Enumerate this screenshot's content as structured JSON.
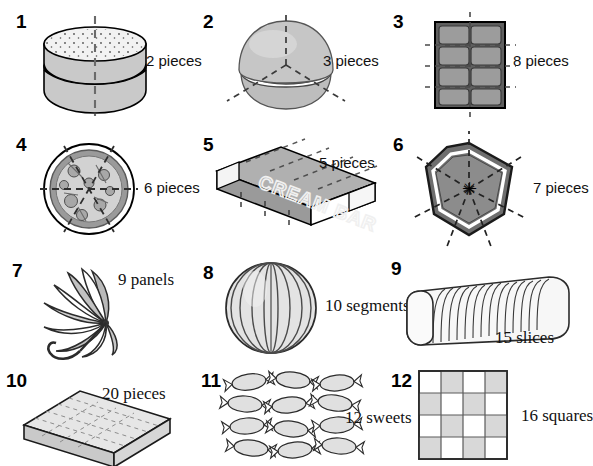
{
  "page": {
    "columns": 3,
    "rows": 4,
    "label_font_rows": [
      "sans",
      "sans",
      "serif",
      "serif"
    ],
    "colors": {
      "ink": "#1a1a1a",
      "outline": "#000000",
      "fill_light": "#dcdcdc",
      "fill_mid": "#b5b5b5",
      "fill_dark": "#8a8a8a",
      "fill_darker": "#6e6e6e",
      "white": "#ffffff",
      "dash": "#333333"
    }
  },
  "items": [
    {
      "number": "1",
      "label": "2 pieces",
      "object": "burger-bun",
      "icon": "bun-icon",
      "count": 2,
      "unit": "pieces",
      "cut_lines": 1,
      "cut_style": "vertical-dashed"
    },
    {
      "number": "2",
      "label": "3 pieces",
      "object": "round-bun",
      "icon": "round-bun-icon",
      "count": 3,
      "unit": "pieces",
      "cut_lines": 3,
      "cut_style": "radial-dashed-y"
    },
    {
      "number": "3",
      "label": "8 pieces",
      "object": "chocolate-bar",
      "icon": "chocolate-bar-icon",
      "count": 8,
      "unit": "pieces",
      "grid_cols": 2,
      "grid_rows": 4
    },
    {
      "number": "4",
      "label": "6 pieces",
      "object": "pizza",
      "icon": "pizza-icon",
      "count": 6,
      "unit": "pieces",
      "cut_lines": 3,
      "cut_style": "radial-dashed"
    },
    {
      "number": "5",
      "label": "5 pieces",
      "object": "cream-bar",
      "icon": "cream-bar-icon",
      "count": 5,
      "unit": "pieces",
      "brand_text": "CREAM BAR",
      "segments": 5
    },
    {
      "number": "6",
      "label": "7 pieces",
      "object": "heptagon-cake",
      "icon": "heptagon-icon",
      "count": 7,
      "unit": "pieces",
      "cut_lines": 7,
      "cut_style": "radial-dashed",
      "sides": 7
    },
    {
      "number": "7",
      "label": "9 panels",
      "object": "umbrella",
      "icon": "umbrella-icon",
      "count": 9,
      "unit": "panels",
      "panels": 9
    },
    {
      "number": "8",
      "label": "10 segments",
      "object": "melon",
      "icon": "melon-icon",
      "count": 10,
      "unit": "segments",
      "segments": 10
    },
    {
      "number": "9",
      "label": "15 slices",
      "object": "sliced-bread-loaf",
      "icon": "bread-loaf-icon",
      "count": 15,
      "unit": "slices",
      "slices": 15
    },
    {
      "number": "10",
      "label": "20 pieces",
      "object": "sheet-cake",
      "icon": "sheet-cake-icon",
      "count": 20,
      "unit": "pieces",
      "grid_cols": 5,
      "grid_rows": 4
    },
    {
      "number": "11",
      "label": "12 sweets",
      "object": "wrapped-sweets",
      "icon": "sweet-icon",
      "count": 12,
      "unit": "sweets",
      "grid_cols": 3,
      "grid_rows": 4
    },
    {
      "number": "12",
      "label": "16 squares",
      "object": "checkerboard",
      "icon": "checkerboard-icon",
      "count": 16,
      "unit": "squares",
      "grid_cols": 4,
      "grid_rows": 4
    }
  ]
}
